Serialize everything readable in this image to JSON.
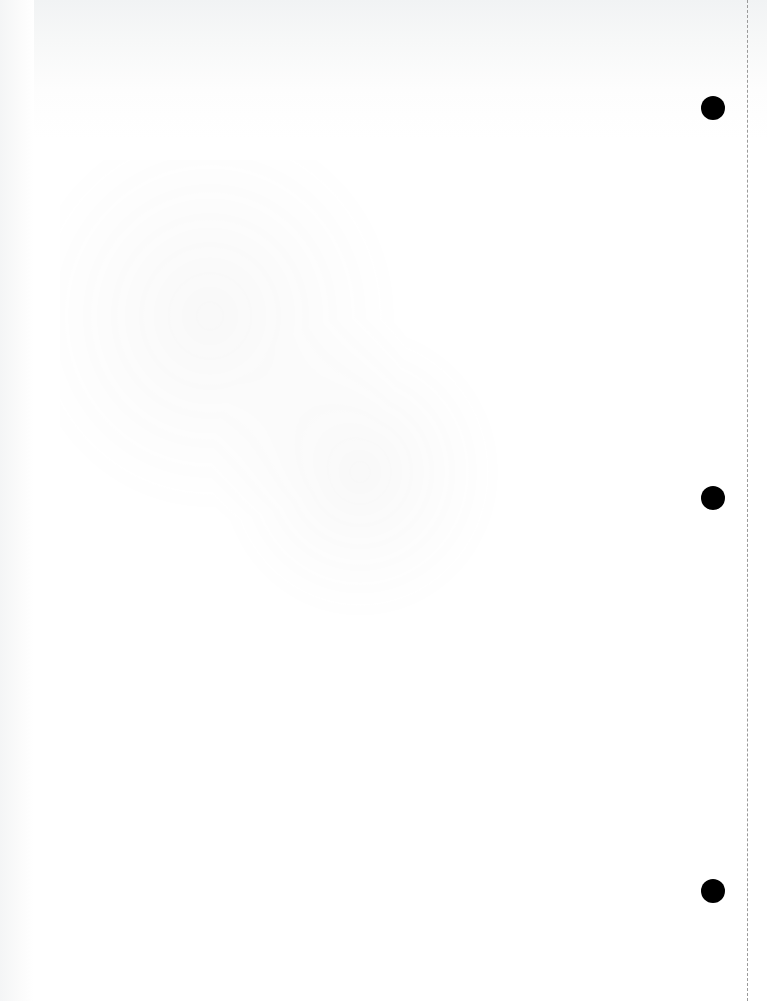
{
  "page": {
    "type": "blank-scanned-page",
    "background_color": "#ffffff",
    "punch_holes": [
      {
        "x": 713,
        "y": 108
      },
      {
        "x": 713,
        "y": 498
      },
      {
        "x": 713,
        "y": 891
      }
    ],
    "perforation_line_x": 747
  }
}
